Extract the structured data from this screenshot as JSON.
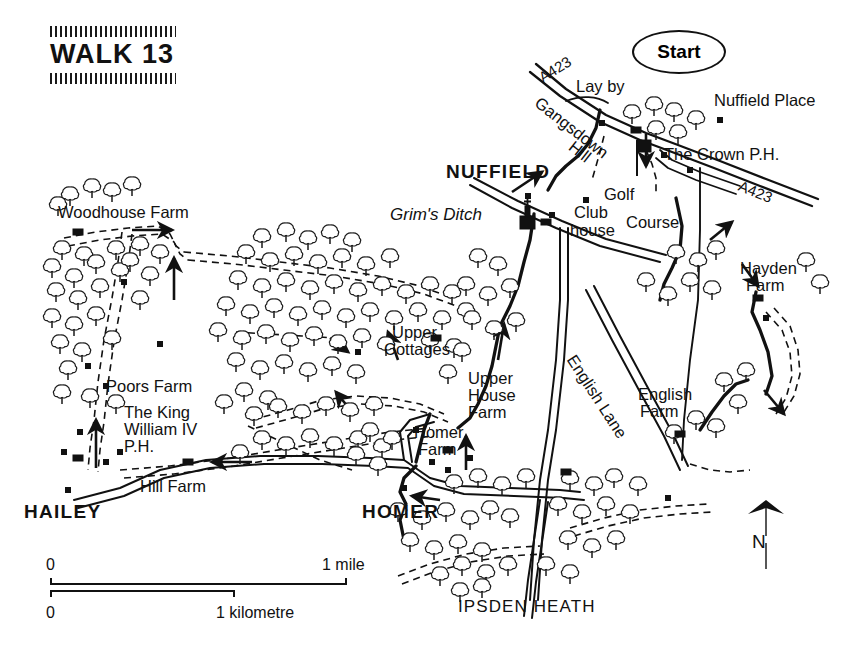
{
  "title": {
    "text": "WALK 13"
  },
  "map": {
    "start_marker": "Start",
    "north_label": "N",
    "places": [
      {
        "name": "NUFFIELD"
      },
      {
        "name": "HAILEY"
      },
      {
        "name": "HOMER"
      },
      {
        "name": "IPSDEN HEATH"
      }
    ],
    "features": [
      {
        "name": "Nuffield Place"
      },
      {
        "name": "The Crown P.H."
      },
      {
        "name": "Woodhouse Farm"
      },
      {
        "name": "Poors Farm"
      },
      {
        "name": "The King"
      },
      {
        "name": "William IV"
      },
      {
        "name": "P.H."
      },
      {
        "name": "Hill Farm"
      },
      {
        "name": "Upper"
      },
      {
        "name": "Cottages"
      },
      {
        "name": "Upper"
      },
      {
        "name": "House"
      },
      {
        "name": "Farm"
      },
      {
        "name": "Homer"
      },
      {
        "name": "Farm"
      },
      {
        "name": "English"
      },
      {
        "name": "Farm"
      },
      {
        "name": "Hayden"
      },
      {
        "name": "Farm"
      },
      {
        "name": "Club"
      },
      {
        "name": "house"
      },
      {
        "name": "Golf"
      },
      {
        "name": "Course"
      },
      {
        "name": "Lay by"
      }
    ],
    "landmarks": {
      "grims_ditch": "Grim's Ditch",
      "nuffield_place": "Nuffield Place",
      "crown_ph": "The Crown P.H.",
      "woodhouse_farm": "Woodhouse Farm",
      "poors_farm": "Poors Farm",
      "king_william_1": "The King",
      "king_william_2": "William IV",
      "king_william_3": "P.H.",
      "hill_farm": "Hill Farm",
      "upper_cottages_1": "Upper",
      "upper_cottages_2": "Cottages",
      "upper_house_1": "Upper",
      "upper_house_2": "House",
      "upper_house_3": "Farm",
      "homer_farm_1": "Homer",
      "homer_farm_2": "Farm",
      "english_farm_1": "English",
      "english_farm_2": "Farm",
      "hayden_farm_1": "Hayden",
      "hayden_farm_2": "Farm",
      "club_house_1": "Club",
      "club_house_2": "house",
      "golf": "Golf",
      "course": "Course",
      "lay_by": "Lay by"
    },
    "roads": {
      "a423_top": "A423",
      "a423_right": "A423",
      "gangsdown": "Gangsdown",
      "hill": "Hill",
      "english_lane": "English Lane"
    }
  },
  "scale": {
    "miles": {
      "start": "0",
      "end": "1 mile"
    },
    "kilometres": {
      "start": "0",
      "end": "1 kilometre"
    }
  },
  "colors": {
    "ink": "#111111",
    "paper": "#ffffff"
  }
}
